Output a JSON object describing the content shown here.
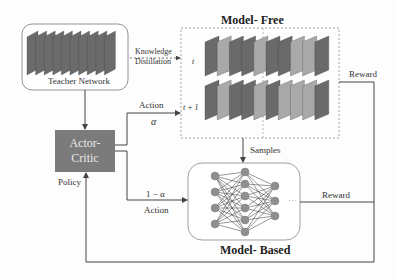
{
  "teacher": {
    "label": "Teacher Network",
    "layers": 10
  },
  "distillation": {
    "line1": "Knowledge",
    "line2": "Distillation"
  },
  "model_free": {
    "title": "Model- Free",
    "rows": [
      {
        "label": "t",
        "shades": [
          "#6a6a6a",
          "#a9a9a9",
          "#6a6a6a",
          "#6a6a6a",
          "#a9a9a9",
          "#6a6a6a",
          "#6a6a6a",
          "#a9a9a9",
          "#a9a9a9",
          "#6a6a6a"
        ]
      },
      {
        "label": "t + 1",
        "shades": [
          "#6a6a6a",
          "#a9a9a9",
          "#6a6a6a",
          "#6a6a6a",
          "#a9a9a9",
          "#6a6a6a",
          "#a9a9a9",
          "#a9a9a9",
          "#a9a9a9",
          "#6a6a6a"
        ]
      }
    ]
  },
  "actor_critic": {
    "line1": "Actor-",
    "line2": "Critic",
    "fill": "#7b7b7b"
  },
  "action_upper": {
    "label": "Action",
    "weight": "α"
  },
  "action_lower": {
    "label": "Action",
    "weight": "1 − α"
  },
  "policy": {
    "label": "Policy"
  },
  "samples": {
    "label": "Samples"
  },
  "reward_top": {
    "label": "Reward"
  },
  "reward_mid": {
    "label": "Reward"
  },
  "model_based": {
    "title": "Model- Based",
    "layers": [
      4,
      6,
      3
    ],
    "ellipsis": "···"
  }
}
